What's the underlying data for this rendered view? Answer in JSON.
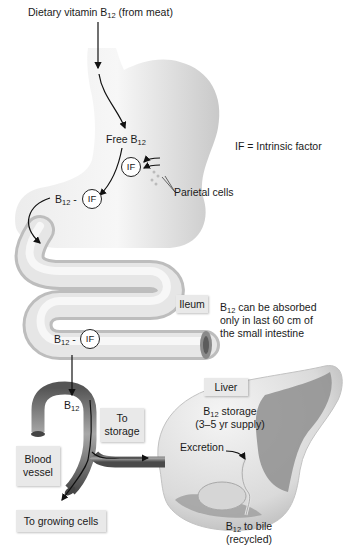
{
  "diagram": {
    "title_label": {
      "prefix": "Dietary vitamin B",
      "sub": "12",
      "suffix": " (from meat)"
    },
    "legend": "IF = Intrinsic factor",
    "stomach": {
      "free_b12": {
        "prefix": "Free B",
        "sub": "12"
      },
      "if_label": "IF",
      "parietal_cells": "Parietal cells",
      "complex": {
        "prefix": "B",
        "sub": "12",
        "suffix": " -",
        "circle": "IF"
      }
    },
    "intestine": {
      "ileum": "Ileum",
      "note_line1": {
        "prefix": "B",
        "sub": "12",
        "suffix": " can be absorbed"
      },
      "note_line2": "only in last 60 cm of",
      "note_line3": "the small intestine",
      "complex": {
        "prefix": "B",
        "sub": "12",
        "suffix": " -",
        "circle": "IF"
      }
    },
    "blood": {
      "b12": {
        "prefix": "B",
        "sub": "12"
      },
      "vessel_line1": "Blood",
      "vessel_line2": "vessel",
      "to_storage_line1": "To",
      "to_storage_line2": "storage",
      "to_growing_cells": "To growing cells"
    },
    "liver": {
      "title": "Liver",
      "storage_line1": {
        "prefix": "B",
        "sub": "12",
        "suffix": " storage"
      },
      "storage_line2": "(3–5 yr supply)",
      "excretion": "Excretion",
      "bile_line1": {
        "prefix": "B",
        "sub": "12",
        "suffix": " to bile"
      },
      "bile_line2": "(recycled)"
    },
    "colors": {
      "organ_light": "#f2f2f2",
      "organ_mid": "#d4d4d4",
      "organ_dark": "#9a9a9a",
      "vessel": "#6e6e6e",
      "arrow": "#111111",
      "box": "#e9e9e9"
    }
  }
}
